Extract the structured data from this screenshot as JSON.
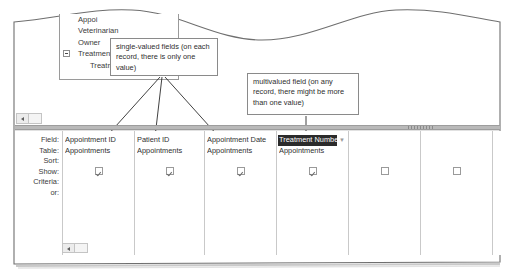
{
  "field_list": {
    "title_truncated": "Appoi",
    "items": [
      {
        "label": "Appoi",
        "truncated": true,
        "expandable": false
      },
      {
        "label": "Veterinarian",
        "truncated": false,
        "expandable": false
      },
      {
        "label": "Owner",
        "truncated": false,
        "expandable": false
      },
      {
        "label": "Treatment Nu",
        "truncated": true,
        "expandable": true
      },
      {
        "label": "Treatment",
        "truncated": false,
        "expandable": false,
        "indent": true
      }
    ]
  },
  "callouts": {
    "single_valued": "single-valued fields (on each record, there is only one value)",
    "multivalued": "multivalued field (on any record, there might be more than one value)"
  },
  "grid": {
    "row_labels": [
      "Field:",
      "Table:",
      "Sort:",
      "Show:",
      "Criteria:",
      "or:"
    ],
    "columns": [
      {
        "field": "Appointment ID",
        "table": "Appointments",
        "show": true,
        "selected": false,
        "has_dropdown": false
      },
      {
        "field": "Patient ID",
        "table": "Appointments",
        "show": true,
        "selected": false,
        "has_dropdown": false
      },
      {
        "field": "Appointment Date",
        "table": "Appointments",
        "show": true,
        "selected": false,
        "has_dropdown": false
      },
      {
        "field": "Treatment Numbe",
        "table": "Appointments",
        "show": true,
        "selected": true,
        "has_dropdown": true,
        "dropdown_icon": "chevron-down-icon"
      },
      {
        "field": "",
        "table": "",
        "show": false,
        "selected": false,
        "has_dropdown": false
      },
      {
        "field": "",
        "table": "",
        "show": false,
        "selected": false,
        "has_dropdown": false
      }
    ]
  },
  "scrollbars": {
    "upper_left_arrow_icon": "scroll-left-arrow-icon",
    "grid_left_arrow_icon": "scroll-left-arrow-icon"
  },
  "colors": {
    "selection_bg": "#2b2b2b",
    "selection_fg": "#ffffff",
    "splitter": "#b9b9b9",
    "border": "#9a9a9a",
    "grid_line": "#c9c9c9",
    "text": "#2f2f2f"
  }
}
